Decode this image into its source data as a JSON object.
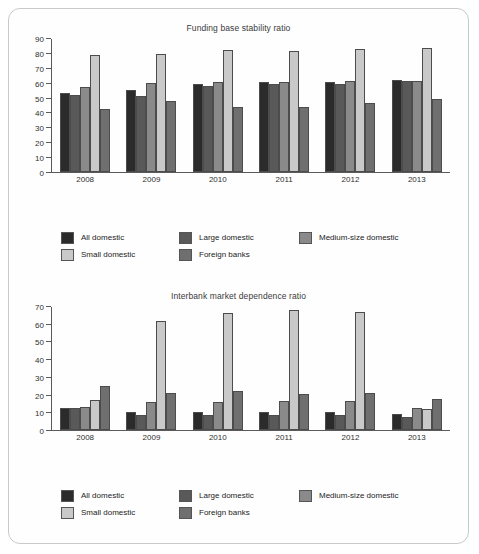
{
  "figure": {
    "border_color": "#c9c9c9",
    "background": "#fefefe"
  },
  "series_colors": [
    "#2b2b2b",
    "#595959",
    "#8a8a8a",
    "#c9c9c9",
    "#6f6f6f"
  ],
  "legend": {
    "items": [
      {
        "label": "All domestic",
        "color": "#2b2b2b"
      },
      {
        "label": "Large domestic",
        "color": "#595959"
      },
      {
        "label": "Medium-size domestic",
        "color": "#8a8a8a"
      },
      {
        "label": "Small domestic",
        "color": "#c9c9c9"
      },
      {
        "label": "Foreign banks",
        "color": "#6f6f6f"
      }
    ]
  },
  "chart_data": [
    {
      "type": "bar",
      "title": "Funding base stability ratio",
      "xlabel": "",
      "ylabel": "",
      "categories": [
        "2008",
        "2009",
        "2010",
        "2011",
        "2012",
        "2013"
      ],
      "ylim": [
        0,
        90
      ],
      "yticks": [
        0,
        10,
        20,
        30,
        40,
        50,
        60,
        70,
        80,
        90
      ],
      "grid": false,
      "legend_position": "bottom",
      "series": [
        {
          "name": "All domestic",
          "color": "#2b2b2b",
          "values": [
            53.5,
            55.3,
            59.8,
            61.0,
            60.8,
            62.2
          ]
        },
        {
          "name": "Large domestic",
          "color": "#595959",
          "values": [
            52.3,
            51.3,
            58.2,
            59.6,
            59.4,
            61.3
          ]
        },
        {
          "name": "Medium-size domestic",
          "color": "#8a8a8a",
          "values": [
            57.6,
            60.0,
            60.7,
            61.0,
            61.4,
            61.8
          ]
        },
        {
          "name": "Small domestic",
          "color": "#c9c9c9",
          "values": [
            79.4,
            79.8,
            82.3,
            82.2,
            83.5,
            83.7
          ]
        },
        {
          "name": "Foreign banks",
          "color": "#6f6f6f",
          "values": [
            42.4,
            48.0,
            43.7,
            44.3,
            47.0,
            49.3
          ]
        }
      ]
    },
    {
      "type": "bar",
      "title": "Interbank market dependence ratio",
      "xlabel": "",
      "ylabel": "",
      "categories": [
        "2008",
        "2009",
        "2010",
        "2011",
        "2012",
        "2013"
      ],
      "ylim": [
        0,
        70
      ],
      "yticks": [
        0,
        10,
        20,
        30,
        40,
        50,
        60,
        70
      ],
      "grid": false,
      "legend_position": "bottom",
      "series": [
        {
          "name": "All domestic",
          "color": "#2b2b2b",
          "values": [
            12.5,
            10.3,
            10.1,
            10.1,
            10.3,
            9.0
          ]
        },
        {
          "name": "Large domestic",
          "color": "#595959",
          "values": [
            12.5,
            8.6,
            8.3,
            8.5,
            8.7,
            7.5
          ]
        },
        {
          "name": "Medium-size domestic",
          "color": "#8a8a8a",
          "values": [
            13.2,
            16.2,
            16.1,
            16.3,
            16.3,
            12.3
          ]
        },
        {
          "name": "Small domestic",
          "color": "#c9c9c9",
          "values": [
            17.2,
            62.3,
            66.5,
            68.1,
            67.3,
            12.2
          ]
        },
        {
          "name": "Foreign banks",
          "color": "#6f6f6f",
          "values": [
            25.3,
            21.1,
            22.0,
            20.7,
            20.8,
            17.9
          ]
        }
      ]
    }
  ]
}
